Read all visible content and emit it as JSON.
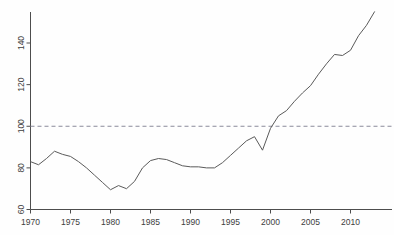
{
  "figure": {
    "cropped_title_fragment": "",
    "background_color": "#fefefe",
    "line_color": "#5a5a5a",
    "axis_color": "#4d4d4d",
    "reference_line_color": "#8b8b9a"
  },
  "chart_data": {
    "type": "line",
    "title": "",
    "subtitle": "",
    "xlabel": "",
    "ylabel": "",
    "xlim": [
      1969,
      1970,
      2014
    ],
    "ylim": [
      60,
      160
    ],
    "xticks": [
      1970,
      1975,
      1980,
      1985,
      1990,
      1995,
      2000,
      2005,
      2010
    ],
    "yticks": [
      60,
      80,
      100,
      120,
      140
    ],
    "xtick_labels": [
      "1970",
      "1975",
      "1980",
      "1985",
      "1990",
      "1995",
      "2000",
      "2005",
      "2010"
    ],
    "ytick_labels": [
      "60",
      "80",
      "100",
      "120",
      "140"
    ],
    "grid": false,
    "legend": null,
    "annotations": [
      {
        "type": "hline",
        "value": 100,
        "style": "dashed",
        "label": "100 reference"
      }
    ],
    "series": [
      {
        "name": "index",
        "x": [
          1970,
          1971,
          1972,
          1973,
          1974,
          1975,
          1976,
          1977,
          1978,
          1979,
          1980,
          1981,
          1982,
          1983,
          1984,
          1985,
          1986,
          1987,
          1988,
          1989,
          1990,
          1991,
          1992,
          1993,
          1994,
          1995,
          1996,
          1997,
          1998,
          1999,
          2000,
          2001,
          2002,
          2003,
          2004,
          2005,
          2006,
          2007,
          2008,
          2009,
          2010,
          2011,
          2012,
          2013
        ],
        "values": [
          83.0,
          81.5,
          84.5,
          88.0,
          86.5,
          85.5,
          83.0,
          80.0,
          76.5,
          73.0,
          69.5,
          71.5,
          70.0,
          73.5,
          80.0,
          83.5,
          84.5,
          84.0,
          82.5,
          81.0,
          80.5,
          80.5,
          80.0,
          80.0,
          82.5,
          86.0,
          89.5,
          93.0,
          95.0,
          88.5,
          99.0,
          105.0,
          107.5,
          112.0,
          116.0,
          119.5,
          125.0,
          130.0,
          134.5,
          134.0,
          136.5,
          143.5,
          148.5,
          155.0
        ]
      }
    ]
  }
}
